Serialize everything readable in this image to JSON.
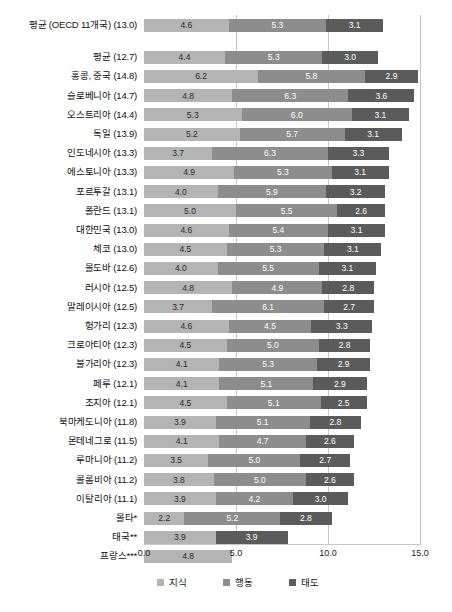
{
  "chart_data": {
    "type": "bar",
    "title": "",
    "subtitle": "",
    "orientation": "horizontal",
    "stacked": true,
    "xlabel": "",
    "ylabel": "",
    "xlim": [
      0.0,
      15.0
    ],
    "xticks": [
      "0.0",
      "5.0",
      "10.0",
      "15.0"
    ],
    "xtick_values": [
      0.0,
      5.0,
      10.0,
      15.0
    ],
    "grid": "vertical",
    "legend_position": "bottom",
    "legend": [
      {
        "key": "knowledge",
        "label": "지식",
        "color": "#b4b4b4"
      },
      {
        "key": "behavior",
        "label": "행동",
        "color": "#8d8d8d"
      },
      {
        "key": "attitude",
        "label": "태도",
        "color": "#5b5b5b"
      }
    ],
    "series": [
      {
        "name": "지식",
        "key": "knowledge",
        "color": "#b4b4b4"
      },
      {
        "name": "행동",
        "key": "behavior",
        "color": "#8d8d8d"
      },
      {
        "name": "태도",
        "key": "attitude",
        "color": "#5b5b5b"
      }
    ],
    "categories": [
      "평균 (OECD 11개국) (13.0)",
      "평균 (12.7)",
      "홍콩, 중국 (14.8)",
      "슬로베니아 (14.7)",
      "오스트리아 (14.4)",
      "독일 (13.9)",
      "인도네시아 (13.3)",
      "에스토니아 (13.3)",
      "포르투갈 (13.1)",
      "폴란드 (13.1)",
      "대한민국 (13.0)",
      "체코 (13.0)",
      "몰도바 (12.6)",
      "러시아 (12.5)",
      "말레이시아 (12.5)",
      "헝가리 (12.3)",
      "크로아티아 (12.3)",
      "불가리아 (12.3)",
      "페루 (12.1)",
      "조지아 (12.1)",
      "북마케도니아 (11.8)",
      "몬테네그로 (11.5)",
      "루마니아 (11.2)",
      "콜롬비아 (11.2)",
      "이탈리아 (11.1)",
      "몰타*",
      "태국**",
      "프랑스***"
    ],
    "rows": [
      {
        "label": "평균 (OECD 11개국) (13.0)",
        "group": "average",
        "gap_after": true,
        "values": [
          4.6,
          5.3,
          3.1
        ],
        "labels": [
          "4.6",
          "5.3",
          "3.1"
        ]
      },
      {
        "label": "평균 (12.7)",
        "group": "average",
        "gap_after": false,
        "values": [
          4.4,
          5.3,
          3.0
        ],
        "labels": [
          "4.4",
          "5.3",
          "3.0"
        ]
      },
      {
        "label": "홍콩, 중국 (14.8)",
        "group": "country",
        "gap_after": false,
        "values": [
          6.2,
          5.8,
          2.9
        ],
        "labels": [
          "6.2",
          "5.8",
          "2.9"
        ]
      },
      {
        "label": "슬로베니아 (14.7)",
        "group": "country",
        "gap_after": false,
        "values": [
          4.8,
          6.3,
          3.6
        ],
        "labels": [
          "4.8",
          "6.3",
          "3.6"
        ]
      },
      {
        "label": "오스트리아 (14.4)",
        "group": "country",
        "gap_after": false,
        "values": [
          5.3,
          6.0,
          3.1
        ],
        "labels": [
          "5.3",
          "6.0",
          "3.1"
        ]
      },
      {
        "label": "독일 (13.9)",
        "group": "country",
        "gap_after": false,
        "values": [
          5.2,
          5.7,
          3.1
        ],
        "labels": [
          "5.2",
          "5.7",
          "3.1"
        ]
      },
      {
        "label": "인도네시아 (13.3)",
        "group": "country",
        "gap_after": false,
        "values": [
          3.7,
          6.3,
          3.3
        ],
        "labels": [
          "3.7",
          "6.3",
          "3.3"
        ]
      },
      {
        "label": "에스토니아 (13.3)",
        "group": "country",
        "gap_after": false,
        "values": [
          4.9,
          5.3,
          3.1
        ],
        "labels": [
          "4.9",
          "5.3",
          "3.1"
        ]
      },
      {
        "label": "포르투갈 (13.1)",
        "group": "country",
        "gap_after": false,
        "values": [
          4.0,
          5.9,
          3.2
        ],
        "labels": [
          "4.0",
          "5.9",
          "3.2"
        ]
      },
      {
        "label": "폴란드 (13.1)",
        "group": "country",
        "gap_after": false,
        "values": [
          5.0,
          5.5,
          2.6
        ],
        "labels": [
          "5.0",
          "5.5",
          "2.6"
        ]
      },
      {
        "label": "대한민국 (13.0)",
        "group": "country",
        "gap_after": false,
        "values": [
          4.6,
          5.4,
          3.1
        ],
        "labels": [
          "4.6",
          "5.4",
          "3.1"
        ]
      },
      {
        "label": "체코 (13.0)",
        "group": "country",
        "gap_after": false,
        "values": [
          4.5,
          5.3,
          3.1
        ],
        "labels": [
          "4.5",
          "5.3",
          "3.1"
        ]
      },
      {
        "label": "몰도바 (12.6)",
        "group": "country",
        "gap_after": false,
        "values": [
          4.0,
          5.5,
          3.1
        ],
        "labels": [
          "4.0",
          "5.5",
          "3.1"
        ]
      },
      {
        "label": "러시아 (12.5)",
        "group": "country",
        "gap_after": false,
        "values": [
          4.8,
          4.9,
          2.8
        ],
        "labels": [
          "4.8",
          "4.9",
          "2.8"
        ]
      },
      {
        "label": "말레이시아 (12.5)",
        "group": "country",
        "gap_after": false,
        "values": [
          3.7,
          6.1,
          2.7
        ],
        "labels": [
          "3.7",
          "6.1",
          "2.7"
        ]
      },
      {
        "label": "헝가리 (12.3)",
        "group": "country",
        "gap_after": false,
        "values": [
          4.6,
          4.5,
          3.3
        ],
        "labels": [
          "4.6",
          "4.5",
          "3.3"
        ]
      },
      {
        "label": "크로아티아 (12.3)",
        "group": "country",
        "gap_after": false,
        "values": [
          4.5,
          5.0,
          2.8
        ],
        "labels": [
          "4.5",
          "5.0",
          "2.8"
        ]
      },
      {
        "label": "불가리아 (12.3)",
        "group": "country",
        "gap_after": false,
        "values": [
          4.1,
          5.3,
          2.9
        ],
        "labels": [
          "4.1",
          "5.3",
          "2.9"
        ]
      },
      {
        "label": "페루 (12.1)",
        "group": "country",
        "gap_after": false,
        "values": [
          4.1,
          5.1,
          2.9
        ],
        "labels": [
          "4.1",
          "5.1",
          "2.9"
        ]
      },
      {
        "label": "조지아 (12.1)",
        "group": "country",
        "gap_after": false,
        "values": [
          4.5,
          5.1,
          2.5
        ],
        "labels": [
          "4.5",
          "5.1",
          "2.5"
        ]
      },
      {
        "label": "북마케도니아 (11.8)",
        "group": "country",
        "gap_after": false,
        "values": [
          3.9,
          5.1,
          2.8
        ],
        "labels": [
          "3.9",
          "5.1",
          "2.8"
        ]
      },
      {
        "label": "몬테네그로 (11.5)",
        "group": "country",
        "gap_after": false,
        "values": [
          4.1,
          4.7,
          2.6
        ],
        "labels": [
          "4.1",
          "4.7",
          "2.6"
        ]
      },
      {
        "label": "루마니아 (11.2)",
        "group": "country",
        "gap_after": false,
        "values": [
          3.5,
          5.0,
          2.7
        ],
        "labels": [
          "3.5",
          "5.0",
          "2.7"
        ]
      },
      {
        "label": "콜롬비아 (11.2)",
        "group": "country",
        "gap_after": false,
        "values": [
          3.8,
          5.0,
          2.6
        ],
        "labels": [
          "3.8",
          "5.0",
          "2.6"
        ]
      },
      {
        "label": "이탈리아 (11.1)",
        "group": "country",
        "gap_after": false,
        "values": [
          3.9,
          4.2,
          3.0
        ],
        "labels": [
          "3.9",
          "4.2",
          "3.0"
        ]
      },
      {
        "label": "몰타*",
        "group": "country",
        "gap_after": false,
        "values": [
          2.2,
          5.2,
          2.8
        ],
        "labels": [
          "2.2",
          "5.2",
          "2.8"
        ]
      },
      {
        "label": "태국**",
        "group": "country",
        "gap_after": false,
        "values": [
          3.9,
          0,
          3.9
        ],
        "labels": [
          "3.9",
          "",
          "3.9"
        ]
      },
      {
        "label": "프랑스***",
        "group": "country",
        "gap_after": false,
        "values": [
          4.8,
          0,
          0
        ],
        "labels": [
          "4.8",
          "",
          ""
        ]
      }
    ]
  }
}
